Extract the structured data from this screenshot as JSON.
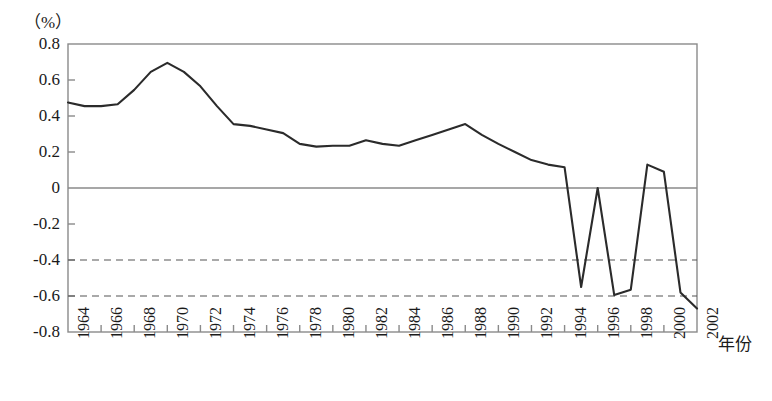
{
  "chart_data": {
    "type": "line",
    "title": "",
    "unit_label": "（%）",
    "xlabel": "年份",
    "ylabel": "",
    "xlim": [
      1964,
      2002
    ],
    "ylim": [
      -0.8,
      0.8
    ],
    "ytick_labels": [
      "0.8",
      "0.6",
      "0.4",
      "0.2",
      "0",
      "-0.2",
      "-0.4",
      "-0.6",
      "-0.8"
    ],
    "ytick_values": [
      0.8,
      0.6,
      0.4,
      0.2,
      0,
      -0.2,
      -0.4,
      -0.6,
      -0.8
    ],
    "xtick_labels": [
      "1964",
      "1966",
      "1968",
      "1970",
      "1972",
      "1974",
      "1976",
      "1978",
      "1980",
      "1982",
      "1984",
      "1986",
      "1988",
      "1990",
      "1992",
      "1994",
      "1996",
      "1998",
      "2000",
      "2002"
    ],
    "xtick_values": [
      1964,
      1966,
      1968,
      1970,
      1972,
      1974,
      1976,
      1978,
      1980,
      1982,
      1984,
      1986,
      1988,
      1990,
      1992,
      1994,
      1996,
      1998,
      2000,
      2002
    ],
    "grid": false,
    "zero_line": 0,
    "reference_lines": [
      -0.4,
      -0.6
    ],
    "reference_line_style": "dashed",
    "legend": [],
    "line_color": "#2b2b2b",
    "axis_color": "#8a8a8a",
    "x": [
      1964,
      1965,
      1966,
      1967,
      1968,
      1969,
      1970,
      1971,
      1972,
      1973,
      1974,
      1975,
      1976,
      1977,
      1978,
      1979,
      1980,
      1981,
      1982,
      1983,
      1984,
      1985,
      1986,
      1987,
      1988,
      1989,
      1990,
      1991,
      1992,
      1993,
      1994,
      1995,
      1996,
      1997,
      1998,
      1999,
      2000,
      2001,
      2002
    ],
    "values": [
      0.475,
      0.455,
      0.455,
      0.465,
      0.545,
      0.645,
      0.695,
      0.645,
      0.565,
      0.455,
      0.355,
      0.345,
      0.325,
      0.305,
      0.245,
      0.23,
      0.235,
      0.235,
      0.265,
      0.245,
      0.235,
      0.265,
      0.295,
      0.325,
      0.355,
      0.295,
      0.245,
      0.2,
      0.155,
      0.13,
      0.115,
      -0.55,
      0.0,
      -0.595,
      -0.565,
      0.13,
      0.09,
      -0.58,
      -0.67
    ]
  }
}
